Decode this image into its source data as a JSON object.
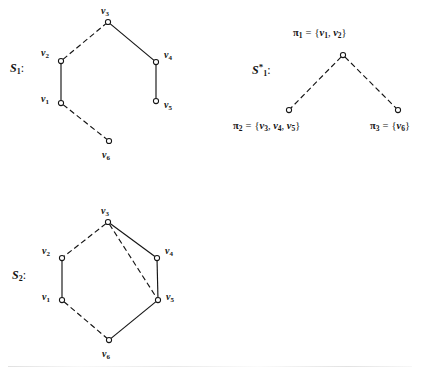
{
  "figure": {
    "width": 433,
    "height": 371,
    "background": "#ffffff",
    "stroke_color": "#151515",
    "node_fill": "#ffffff"
  },
  "diagrams": [
    {
      "id": "S1",
      "label": "S",
      "label_sub": "1",
      "label_sup": "",
      "label_colon": ":",
      "label_x": 10,
      "label_y": 62,
      "nodes": [
        {
          "name": "v3",
          "label": "v",
          "sub": "3",
          "x": 108,
          "y": 22,
          "label_x": 101,
          "label_y": 6
        },
        {
          "name": "v2",
          "label": "v",
          "sub": "2",
          "x": 61,
          "y": 61,
          "label_x": 41,
          "label_y": 48
        },
        {
          "name": "v4",
          "label": "v",
          "sub": "4",
          "x": 156,
          "y": 62,
          "label_x": 164,
          "label_y": 50
        },
        {
          "name": "v1",
          "label": "v",
          "sub": "1",
          "x": 61,
          "y": 103,
          "label_x": 41,
          "label_y": 94
        },
        {
          "name": "v5",
          "label": "v",
          "sub": "5",
          "x": 156,
          "y": 101,
          "label_x": 164,
          "label_y": 100
        },
        {
          "name": "v6",
          "label": "v",
          "sub": "6",
          "x": 109,
          "y": 141,
          "label_x": 102,
          "label_y": 150
        }
      ],
      "edges": [
        {
          "from": "v2",
          "to": "v3",
          "style": "dashed"
        },
        {
          "from": "v3",
          "to": "v4",
          "style": "solid"
        },
        {
          "from": "v2",
          "to": "v1",
          "style": "solid"
        },
        {
          "from": "v4",
          "to": "v5",
          "style": "solid"
        },
        {
          "from": "v1",
          "to": "v6",
          "style": "dashed"
        }
      ]
    },
    {
      "id": "S1star",
      "label": "S",
      "label_sub": "1",
      "label_sup": "*",
      "label_colon": ":",
      "label_x": 252,
      "label_y": 63,
      "nodes": [
        {
          "name": "p1",
          "x": 343,
          "y": 55
        },
        {
          "name": "p2",
          "x": 289,
          "y": 110
        },
        {
          "name": "p3",
          "x": 398,
          "y": 110
        }
      ],
      "edges": [
        {
          "from": "p1",
          "to": "p2",
          "style": "dashed"
        },
        {
          "from": "p1",
          "to": "p3",
          "style": "dashed"
        }
      ],
      "set_labels": [
        {
          "name": "pi1",
          "pi": "π",
          "pi_sub": "1",
          "eq": "=",
          "open": "{",
          "close": "}",
          "members": [
            "1",
            "2"
          ],
          "x": 293,
          "y": 28,
          "align": "left"
        },
        {
          "name": "pi2",
          "pi": "π",
          "pi_sub": "2",
          "eq": "=",
          "open": "{",
          "close": "}",
          "members": [
            "3",
            "4",
            "5"
          ],
          "x": 233,
          "y": 121,
          "align": "left"
        },
        {
          "name": "pi3",
          "pi": "π",
          "pi_sub": "3",
          "eq": "=",
          "open": "{",
          "close": "}",
          "members": [
            "6"
          ],
          "x": 370,
          "y": 121,
          "align": "left"
        }
      ]
    },
    {
      "id": "S2",
      "label": "S",
      "label_sub": "2",
      "label_sup": "",
      "label_colon": ":",
      "label_x": 12,
      "label_y": 269,
      "nodes": [
        {
          "name": "v3",
          "label": "v",
          "sub": "3",
          "x": 108,
          "y": 222,
          "label_x": 101,
          "label_y": 206
        },
        {
          "name": "v2",
          "label": "v",
          "sub": "2",
          "x": 62,
          "y": 258,
          "label_x": 42,
          "label_y": 246
        },
        {
          "name": "v4",
          "label": "v",
          "sub": "4",
          "x": 157,
          "y": 258,
          "label_x": 165,
          "label_y": 246
        },
        {
          "name": "v1",
          "label": "v",
          "sub": "1",
          "x": 62,
          "y": 300,
          "label_x": 42,
          "label_y": 292
        },
        {
          "name": "v5",
          "label": "v",
          "sub": "5",
          "x": 158,
          "y": 300,
          "label_x": 166,
          "label_y": 292
        },
        {
          "name": "v6",
          "label": "v",
          "sub": "6",
          "x": 109,
          "y": 340,
          "label_x": 102,
          "label_y": 349
        }
      ],
      "edges": [
        {
          "from": "v3",
          "to": "v2",
          "style": "dashed"
        },
        {
          "from": "v3",
          "to": "v4",
          "style": "solid"
        },
        {
          "from": "v3",
          "to": "v5",
          "style": "dashed"
        },
        {
          "from": "v2",
          "to": "v1",
          "style": "solid"
        },
        {
          "from": "v4",
          "to": "v5",
          "style": "solid"
        },
        {
          "from": "v1",
          "to": "v6",
          "style": "dashed"
        },
        {
          "from": "v6",
          "to": "v5",
          "style": "solid"
        }
      ]
    }
  ]
}
